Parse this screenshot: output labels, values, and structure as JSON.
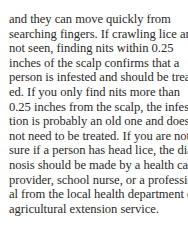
{
  "document": {
    "paragraph_lines": [
      "and they can move quickly from",
      "searching fingers. If crawling lice are",
      "not seen, finding nits within 0.25",
      "inches of the scalp confirms that a",
      "person is infested and should be treat-",
      "ed. If you only find nits more than",
      "0.25 inches from the scalp, the infesta-",
      "tion is probably an old one and does",
      "not need to be treated. If you are not",
      "sure if a person has head lice, the diag-",
      "nosis should be made by a health care",
      "provider, school nurse, or a profession-",
      "al from the local health department or",
      "agricultural extension service."
    ]
  }
}
